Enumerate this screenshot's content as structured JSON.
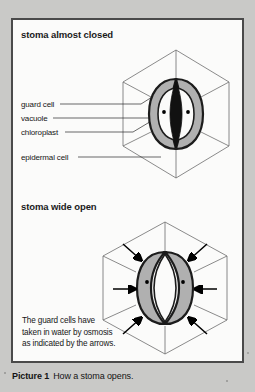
{
  "figure": {
    "caption_label": "Picture 1",
    "caption_text": "How a stoma opens.",
    "panel_border_color": "#4a4a4a",
    "page_background_color": "#c9c9c7",
    "panel_background_color": "#fbfbfa"
  },
  "sections": [
    {
      "id": "closed",
      "heading": "stoma almost closed",
      "state": "almost closed"
    },
    {
      "id": "open",
      "heading": "stoma wide open",
      "state": "wide open"
    }
  ],
  "labels": [
    {
      "id": "guard-cell",
      "text": "guard cell"
    },
    {
      "id": "vacuole",
      "text": "vacuole"
    },
    {
      "id": "chloroplast",
      "text": "chloroplast"
    },
    {
      "id": "epidermal-cell",
      "text": "epidermal cell"
    }
  ],
  "osmosis_note": {
    "line1": "The guard cells have",
    "line2": "taken in water by osmosis",
    "line3": "as indicated by the arrows."
  },
  "diagram_colors": {
    "guard_cell_fill": "#b0b0b0",
    "guard_cell_outline": "#1c1c1c",
    "pore_fill": "#111111",
    "chloroplast_dot": "#000000",
    "cell_wall_line": "#6d6d6d",
    "arrow_color": "#000000"
  }
}
